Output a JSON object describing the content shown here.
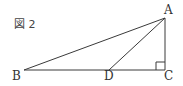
{
  "figure_label": "図 2",
  "points": {
    "A": {
      "label": "A"
    },
    "B": {
      "label": "B"
    },
    "C": {
      "label": "C"
    },
    "D": {
      "label": "D"
    }
  },
  "segments": [
    "AB",
    "AD",
    "AC",
    "BC"
  ],
  "right_angle_at": "C",
  "colors": {
    "line": "#3a3a3a",
    "text": "#333333",
    "background": "#ffffff"
  }
}
